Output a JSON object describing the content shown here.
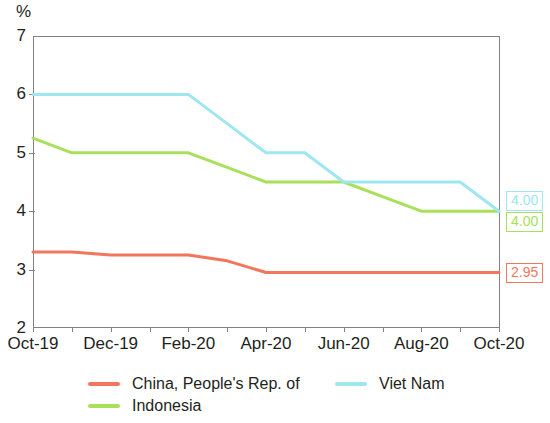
{
  "chart_data": {
    "type": "line",
    "title": "",
    "xlabel": "",
    "ylabel": "%",
    "unit_label": "%",
    "ylim": [
      2,
      7
    ],
    "yticks": [
      2,
      3,
      4,
      5,
      6,
      7
    ],
    "ytick_labels": [
      "2",
      "3",
      "4",
      "5",
      "6",
      "7"
    ],
    "grid": false,
    "legend_position": "bottom",
    "x": [
      "Oct-19",
      "Nov-19",
      "Dec-19",
      "Jan-20",
      "Feb-20",
      "Mar-20",
      "Apr-20",
      "May-20",
      "Jun-20",
      "Jul-20",
      "Aug-20",
      "Sep-20",
      "Oct-20"
    ],
    "xtick_labels": [
      "Oct-19",
      "Dec-19",
      "Feb-20",
      "Apr-20",
      "Jun-20",
      "Aug-20",
      "Oct-20"
    ],
    "xtick_positions": [
      0,
      2,
      4,
      6,
      8,
      10,
      12
    ],
    "series": [
      {
        "name": "China, People's Rep. of",
        "color": "#F2765B",
        "values": [
          3.3,
          3.3,
          3.25,
          3.25,
          3.25,
          3.15,
          2.95,
          2.95,
          2.95,
          2.95,
          2.95,
          2.95,
          2.95
        ],
        "end_label": "2.95"
      },
      {
        "name": "Indonesia",
        "color": "#A8E05A",
        "values": [
          5.25,
          5.0,
          5.0,
          5.0,
          5.0,
          4.75,
          4.5,
          4.5,
          4.5,
          4.25,
          4.0,
          4.0,
          4.0
        ],
        "end_label": "4.00"
      },
      {
        "name": "Viet Nam",
        "color": "#9EE6F0",
        "values": [
          6.0,
          6.0,
          6.0,
          6.0,
          6.0,
          5.5,
          5.0,
          5.0,
          4.5,
          4.5,
          4.5,
          4.5,
          4.0
        ],
        "end_label": "4.00"
      }
    ],
    "legend": [
      {
        "label": "China, People's Rep. of",
        "color": "#F2765B"
      },
      {
        "label": "Viet Nam",
        "color": "#9EE6F0"
      },
      {
        "label": "Indonesia",
        "color": "#A8E05A"
      }
    ]
  }
}
